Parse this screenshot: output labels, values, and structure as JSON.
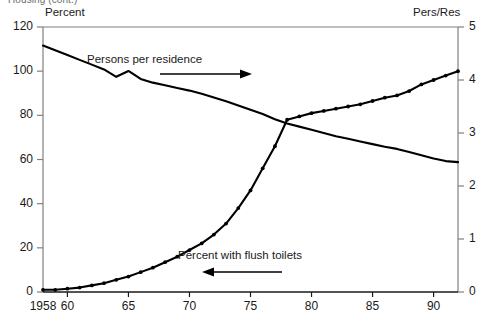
{
  "figure": {
    "clipped_title": "Housing (cont.)",
    "left_axis_header": "Percent",
    "right_axis_header": "Pers/Res"
  },
  "annotations": [
    {
      "name": "persons-per-residence-annotation",
      "text": "Persons per residence",
      "arrow": "right-arrow-icon"
    },
    {
      "name": "percent-flush-toilets-annotation",
      "text": "Percent with flush toilets",
      "arrow": "left-arrow-icon"
    }
  ],
  "chart_data": {
    "type": "line",
    "title": "Housing (cont.)",
    "xlabel": "",
    "ylabel": "Percent",
    "y2label": "Pers/Res",
    "xlim": [
      1958,
      1992
    ],
    "ylim": [
      0,
      120
    ],
    "y2lim": [
      0,
      5
    ],
    "grid": false,
    "legend": "annotations-inline",
    "xticks": [
      1958,
      1960,
      1965,
      1970,
      1975,
      1980,
      1985,
      1990
    ],
    "xtick_labels": [
      "1958",
      "60",
      "65",
      "70",
      "75",
      "80",
      "85",
      "90"
    ],
    "yticks": [
      0,
      20,
      40,
      60,
      80,
      100,
      120
    ],
    "ytick_labels": [
      "0",
      "20",
      "40",
      "60",
      "80",
      "100",
      "120"
    ],
    "y2ticks": [
      0,
      1,
      2,
      3,
      4,
      5
    ],
    "y2tick_labels": [
      "0",
      "1",
      "2",
      "3",
      "4",
      "5"
    ],
    "x": [
      1958,
      1959,
      1960,
      1961,
      1962,
      1963,
      1964,
      1965,
      1966,
      1967,
      1968,
      1969,
      1970,
      1971,
      1972,
      1973,
      1974,
      1975,
      1976,
      1977,
      1978,
      1979,
      1980,
      1981,
      1982,
      1983,
      1984,
      1985,
      1986,
      1987,
      1988,
      1989,
      1990,
      1991,
      1992
    ],
    "series": [
      {
        "name": "Percent with flush toilets",
        "axis": "left",
        "unit": "percent",
        "markers": true,
        "values": [
          1,
          1,
          1.5,
          2,
          3,
          4,
          5.5,
          7,
          9,
          11,
          13.5,
          16,
          19,
          22,
          26,
          31,
          38,
          46,
          56,
          66,
          78,
          79.5,
          81,
          82,
          83,
          84,
          85,
          86.5,
          88,
          89,
          91,
          94,
          96,
          98,
          100
        ]
      },
      {
        "name": "Persons per residence",
        "axis": "right",
        "unit": "persons per residence",
        "markers": false,
        "values": [
          4.65,
          4.56,
          4.47,
          4.38,
          4.29,
          4.2,
          4.06,
          4.17,
          4.02,
          3.95,
          3.9,
          3.85,
          3.8,
          3.74,
          3.67,
          3.6,
          3.52,
          3.44,
          3.36,
          3.26,
          3.18,
          3.12,
          3.06,
          3.0,
          2.94,
          2.89,
          2.84,
          2.79,
          2.74,
          2.7,
          2.64,
          2.58,
          2.52,
          2.47,
          2.45
        ]
      }
    ]
  }
}
